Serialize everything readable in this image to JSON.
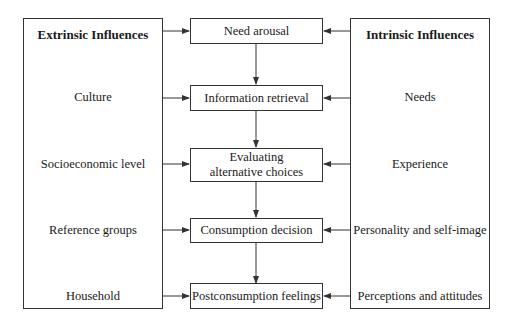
{
  "diagram": {
    "extrinsic": {
      "title": "Extrinsic Influences",
      "items": [
        "Culture",
        "Socioeconomic level",
        "Reference groups",
        "Household"
      ]
    },
    "intrinsic": {
      "title": "Intrinsic Influences",
      "items": [
        "Needs",
        "Experience",
        "Personality and self-image",
        "Perceptions and attitudes"
      ]
    },
    "stages": [
      {
        "label": "Need arousal"
      },
      {
        "label": "Information retrieval"
      },
      {
        "label": "Evaluating alternative choices"
      },
      {
        "label": "Consumption decision"
      },
      {
        "label": "Postconsumption feelings"
      }
    ],
    "colors": {
      "line": "#333333",
      "background": "#ffffff",
      "text": "#1a1a1a"
    }
  }
}
